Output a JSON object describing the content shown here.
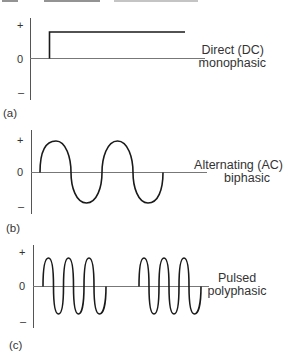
{
  "figure": {
    "panels": [
      {
        "id": "a",
        "tag": "(a)",
        "label_line1": "Direct (DC)",
        "label_line2": "monophasic",
        "ticks": {
          "plus": "+",
          "zero": "0",
          "minus": "–"
        },
        "waveform": "direct-current-step"
      },
      {
        "id": "b",
        "tag": "(b)",
        "label_line1": "Alternating (AC)",
        "label_line2": "biphasic",
        "ticks": {
          "plus": "+",
          "zero": "0",
          "minus": "–"
        },
        "waveform": "sine-2-cycles"
      },
      {
        "id": "c",
        "tag": "(c)",
        "label_line1": "Pulsed",
        "label_line2": "polyphasic",
        "ticks": {
          "plus": "+",
          "zero": "0",
          "minus": "–"
        },
        "waveform": "two-bursts-of-3-cycles"
      }
    ],
    "colors": {
      "stroke": "#1a1a1a",
      "axis": "#555555",
      "text": "#333333"
    }
  }
}
